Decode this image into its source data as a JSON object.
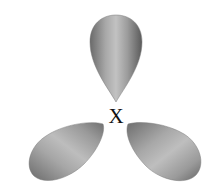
{
  "diagram": {
    "type": "orbital-diagram",
    "center_label": "X",
    "lobes": [
      {
        "name": "top-lobe",
        "direction": "up"
      },
      {
        "name": "lower-left-lobe",
        "direction": "down-left"
      },
      {
        "name": "lower-right-lobe",
        "direction": "down-right"
      }
    ],
    "colors": {
      "lobe_light": "#c4c4c4",
      "lobe_mid": "#9a9a9a",
      "lobe_dark": "#5e5e5e",
      "background": "#ffffff",
      "label": "#111111"
    }
  }
}
